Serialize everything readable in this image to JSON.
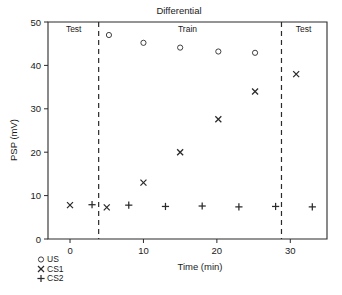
{
  "chart_data": {
    "type": "scatter",
    "title": "Differential",
    "xlabel": "Time  (min)",
    "ylabel": "PSP  (mV)",
    "xlim": [
      -3,
      35
    ],
    "ylim": [
      0,
      50
    ],
    "xticks": [
      0,
      10,
      20,
      30
    ],
    "yticks": [
      0,
      10,
      20,
      30,
      40,
      50
    ],
    "xtick_labels": [
      "0",
      "10",
      "20",
      "30"
    ],
    "ytick_labels": [
      "0",
      "10",
      "20",
      "30",
      "40",
      "50"
    ],
    "grid": false,
    "legend_position": "below-left",
    "series": [
      {
        "name": "US",
        "marker": "circle",
        "points": [
          {
            "x": 5.3,
            "y": 47.0
          },
          {
            "x": 10.0,
            "y": 45.2
          },
          {
            "x": 15.0,
            "y": 44.1
          },
          {
            "x": 20.2,
            "y": 43.2
          },
          {
            "x": 25.2,
            "y": 42.9
          }
        ]
      },
      {
        "name": "CS1",
        "marker": "x",
        "points": [
          {
            "x": 0.0,
            "y": 7.8
          },
          {
            "x": 5.0,
            "y": 7.3
          },
          {
            "x": 10.0,
            "y": 13.0
          },
          {
            "x": 15.0,
            "y": 20.0
          },
          {
            "x": 20.2,
            "y": 27.6
          },
          {
            "x": 25.2,
            "y": 34.0
          },
          {
            "x": 30.8,
            "y": 38.0
          }
        ]
      },
      {
        "name": "CS2",
        "marker": "plus",
        "points": [
          {
            "x": 3.0,
            "y": 7.9
          },
          {
            "x": 8.0,
            "y": 7.8
          },
          {
            "x": 13.0,
            "y": 7.5
          },
          {
            "x": 18.0,
            "y": 7.6
          },
          {
            "x": 23.0,
            "y": 7.4
          },
          {
            "x": 28.0,
            "y": 7.5
          },
          {
            "x": 33.0,
            "y": 7.4
          }
        ]
      }
    ],
    "dividers": [
      {
        "x": 3.9
      },
      {
        "x": 28.8
      }
    ],
    "phase_labels": [
      {
        "text": "Test",
        "x": 0.5,
        "y": 47.8
      },
      {
        "text": "Train",
        "x": 16.0,
        "y": 47.8
      },
      {
        "text": "Test",
        "x": 31.8,
        "y": 47.8
      }
    ],
    "legend_entries": [
      {
        "marker": "circle",
        "label": "US"
      },
      {
        "marker": "x",
        "label": "CS1"
      },
      {
        "marker": "plus",
        "label": "CS2"
      }
    ],
    "colors": {
      "ink": "#2b2b2b",
      "background": "#ffffff"
    }
  }
}
